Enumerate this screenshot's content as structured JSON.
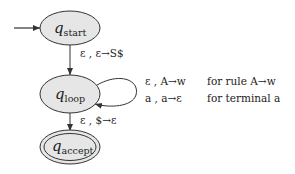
{
  "diagram": {
    "type": "pushdown-automaton",
    "colors": {
      "state_fill": "#e6e6e6",
      "stroke": "#333333",
      "text": "#222222"
    },
    "states": [
      {
        "id": "start",
        "main": "q",
        "sub": "start",
        "initial": true,
        "accepting": false
      },
      {
        "id": "loop",
        "main": "q",
        "sub": "loop",
        "initial": false,
        "accepting": false
      },
      {
        "id": "accept",
        "main": "q",
        "sub": "accept",
        "initial": false,
        "accepting": true
      }
    ],
    "transitions": [
      {
        "from": "start",
        "to": "loop",
        "label": "ε , ε→S$"
      },
      {
        "from": "loop",
        "to": "loop",
        "label": "self-loop"
      },
      {
        "from": "loop",
        "to": "accept",
        "label": "ε , $→ε"
      }
    ],
    "legend": [
      {
        "transition": "ε , A→w",
        "description": "for rule A→w"
      },
      {
        "transition": "a , a→ε",
        "description": "for terminal a"
      }
    ]
  }
}
